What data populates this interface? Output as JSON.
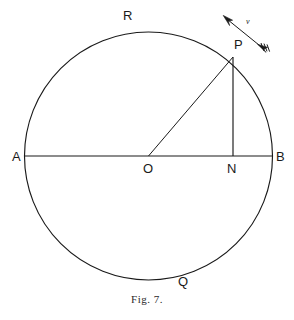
{
  "figure": {
    "caption": "Fig. 7.",
    "title": "Fig. 7.",
    "background_color": "#ffffff",
    "stroke_color": "#1a1a1a",
    "labels": {
      "center": "O",
      "left_end": "A",
      "right_end": "B",
      "foot_of_perpendicular": "N",
      "point_on_circle": "P",
      "top_of_circle": "R",
      "bottom_of_circle": "Q",
      "velocity": "v"
    },
    "geometry": {
      "circle_center_x": 148.5,
      "circle_center_y": 156,
      "circle_radius": 124,
      "point_P_x": 233,
      "point_P_y": 56,
      "point_N_x": 233,
      "point_N_y": 156,
      "point_A_x": 24.5,
      "point_A_y": 156,
      "point_B_x": 272.5,
      "point_B_y": 156,
      "velocity_arrow_tip_x": 224,
      "velocity_arrow_tip_y": 16,
      "velocity_arrow_tail_x": 266,
      "velocity_arrow_tail_y": 50
    },
    "elements": {
      "circle": "circle",
      "diameter": "line-AB",
      "radius": "line-OP",
      "ordinate": "line-PN",
      "velocity_vector": "velocity-arrow"
    }
  }
}
